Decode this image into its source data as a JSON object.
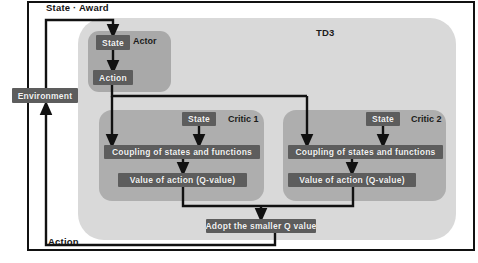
{
  "diagram": {
    "type": "flow-diagram",
    "title": "TD3",
    "outer_label_top": "State · Award",
    "outer_label_bottom": "Action",
    "colors": {
      "page_background": "#ffffff",
      "frame_border": "#111111",
      "td3_container": "#d9d9d9",
      "actor_container": "#a9a9a9",
      "critic_container": "#aeaeae",
      "chip_fill": "#5d5d5d",
      "chip_text": "#f2f2f2",
      "wire": "#111111"
    }
  },
  "environment": {
    "label": "Environment"
  },
  "td3": {
    "title": "TD3",
    "actor": {
      "title": "Actor",
      "state_label": "State",
      "action_label": "Action"
    },
    "critics": [
      {
        "title": "Critic 1",
        "state_label": "State",
        "coupling_label": "Coupling of states and functions",
        "qvalue_label": "Value of action (Q-value)"
      },
      {
        "title": "Critic 2",
        "state_label": "State",
        "coupling_label": "Coupling of states and functions",
        "qvalue_label": "Value of action (Q-value)"
      }
    ],
    "aggregator": {
      "label": "Adopt the smaller Q value"
    }
  },
  "edges": [
    {
      "from": "environment",
      "to": "actor.state",
      "label": "State · Award"
    },
    {
      "from": "actor.state",
      "to": "actor.action",
      "label": ""
    },
    {
      "from": "actor.action",
      "to": "critic1.coupling",
      "label": ""
    },
    {
      "from": "actor.action",
      "to": "critic2.coupling",
      "label": ""
    },
    {
      "from": "critic1.state",
      "to": "critic1.coupling",
      "label": ""
    },
    {
      "from": "critic2.state",
      "to": "critic2.coupling",
      "label": ""
    },
    {
      "from": "critic1.coupling",
      "to": "critic1.qvalue",
      "label": ""
    },
    {
      "from": "critic2.coupling",
      "to": "critic2.qvalue",
      "label": ""
    },
    {
      "from": "critic1.qvalue",
      "to": "aggregator",
      "label": ""
    },
    {
      "from": "critic2.qvalue",
      "to": "aggregator",
      "label": ""
    },
    {
      "from": "aggregator",
      "to": "environment",
      "label": "Action"
    }
  ]
}
